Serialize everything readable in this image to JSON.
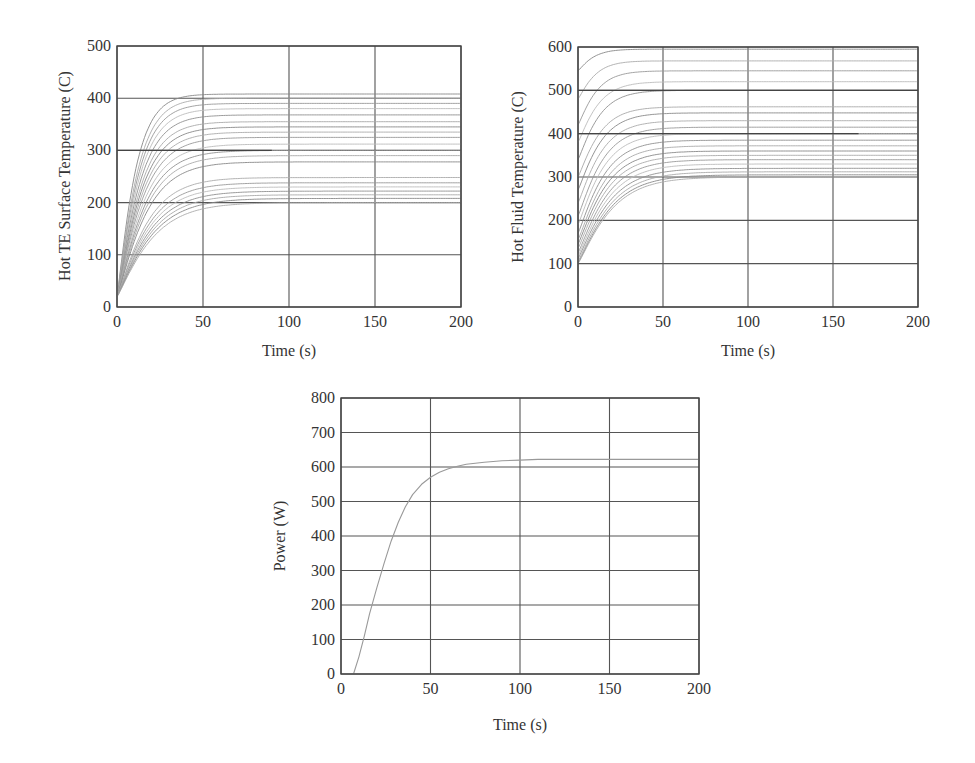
{
  "chart_data": [
    {
      "id": "hot-te-surface",
      "type": "line",
      "title": "",
      "xlabel": "Time (s)",
      "ylabel": "Hot TE Surface Temperature (C)",
      "xlim": [
        0,
        200
      ],
      "ylim": [
        0,
        500
      ],
      "xticks": [
        0,
        50,
        100,
        150,
        200
      ],
      "yticks": [
        0,
        100,
        200,
        300,
        400,
        500
      ],
      "grid": true,
      "legend": null,
      "initial_value": 20,
      "series_final_values": [
        408,
        400,
        390,
        380,
        368,
        355,
        345,
        335,
        325,
        312,
        300,
        290,
        278,
        248,
        238,
        230,
        222,
        215,
        208,
        200
      ],
      "series_time_constants_s": [
        11,
        12,
        12.5,
        13,
        13.5,
        14,
        14.5,
        15,
        15.5,
        16,
        16.5,
        17,
        17.5,
        18,
        18.5,
        19,
        19.5,
        20,
        20.5,
        21
      ],
      "highlight_line": {
        "value": 300,
        "x_end": 90
      },
      "note": "Family of ~20 first-order rise curves starting near 20 C and settling between ~200 and ~408 C by ~60 s"
    },
    {
      "id": "hot-fluid",
      "type": "line",
      "title": "",
      "xlabel": "Time (s)",
      "ylabel": "Hot Fluid Temperature (C)",
      "xlim": [
        0,
        200
      ],
      "ylim": [
        0,
        600
      ],
      "xticks": [
        0,
        50,
        100,
        150,
        200
      ],
      "yticks": [
        0,
        100,
        200,
        300,
        400,
        500,
        600
      ],
      "grid": true,
      "legend": null,
      "series_initial_values": [
        545,
        480,
        420,
        380,
        340,
        300,
        270,
        240,
        210,
        190,
        170,
        155,
        145,
        135,
        125,
        118,
        112,
        106,
        102,
        100
      ],
      "series_final_values": [
        595,
        568,
        545,
        520,
        500,
        462,
        448,
        430,
        415,
        400,
        385,
        372,
        360,
        350,
        340,
        330,
        320,
        312,
        305,
        300
      ],
      "series_time_constants_s": [
        9,
        10,
        11,
        12,
        12.5,
        13,
        13.5,
        14,
        14.5,
        15,
        15.5,
        16,
        16.5,
        17,
        17.5,
        18,
        18.5,
        19,
        19.5,
        20
      ],
      "highlight_lines": [
        {
          "value": 500,
          "x_end": 200
        },
        {
          "value": 400,
          "x_end": 165
        }
      ],
      "note": "Family of ~20 rise curves starting between ~100 and ~545 C, settling between ~300 and ~595 C"
    },
    {
      "id": "power",
      "type": "line",
      "title": "",
      "xlabel": "Time (s)",
      "ylabel": "Power (W)",
      "xlim": [
        0,
        200
      ],
      "ylim": [
        0,
        800
      ],
      "xticks": [
        0,
        50,
        100,
        150,
        200
      ],
      "yticks": [
        0,
        100,
        200,
        300,
        400,
        500,
        600,
        700,
        800
      ],
      "grid": true,
      "legend": null,
      "series": [
        {
          "name": "Power",
          "x": [
            7,
            10,
            13,
            16,
            20,
            24,
            28,
            32,
            36,
            40,
            45,
            50,
            55,
            60,
            65,
            70,
            80,
            90,
            100,
            110,
            120,
            150,
            200
          ],
          "y": [
            0,
            50,
            110,
            175,
            250,
            320,
            385,
            440,
            485,
            520,
            550,
            570,
            585,
            595,
            602,
            608,
            614,
            618,
            620,
            622,
            622,
            622,
            622
          ]
        }
      ]
    }
  ]
}
